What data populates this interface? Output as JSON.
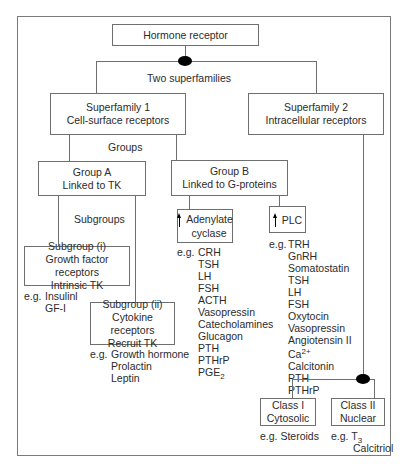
{
  "root": {
    "label": "Hormone receptor"
  },
  "split_label": "Two superfamilies",
  "superfamilies": [
    {
      "line1": "Superfamily 1",
      "line2": "Cell-surface receptors"
    },
    {
      "line1": "Superfamily 2",
      "line2": "Intracellular receptors"
    }
  ],
  "groups_label": "Groups",
  "groups": [
    {
      "line1": "Group A",
      "line2": "Linked to TK"
    },
    {
      "line1": "Group B",
      "line2": "Linked to G-proteins"
    }
  ],
  "subgroups_label": "Subgroups",
  "subgroups": [
    {
      "line1": "Subgroup (i)",
      "line2": "Growth factor receptors",
      "line3": "Intrinsic TK",
      "eg_prefix": "e.g.",
      "examples": [
        "Insulinl",
        "GF-I"
      ]
    },
    {
      "line1": "Subgroup (ii)",
      "line2": "Cytokine receptors",
      "line3": "Recruit TK",
      "eg_prefix": "e.g.",
      "examples": [
        "Growth hormone",
        "Prolactin",
        "Leptin"
      ]
    }
  ],
  "effectors": [
    {
      "label_line1": "Adenylate",
      "label_line2": "cyclase",
      "arrow": "up-arrow",
      "eg_prefix": "e.g.",
      "examples": [
        "CRH",
        "TSH",
        "LH",
        "FSH",
        "ACTH",
        "Vasopressin",
        "Catecholamines",
        "Glucagon",
        "PTH",
        "PTHrP"
      ],
      "last_example_base": "PGE",
      "last_example_sub": "2"
    },
    {
      "label_line1": "PLC",
      "arrow": "up-arrow",
      "eg_prefix": "e.g.",
      "examples_a": [
        "TRH",
        "GnRH",
        "Somatostatin",
        "TSH",
        "LH",
        "FSH",
        "Oxytocin",
        "Vasopressin",
        "Angiotensin II"
      ],
      "ca_base": "Ca",
      "ca_sup": "2+",
      "examples_b": [
        "Calcitonin",
        "PTH",
        "PTHrP"
      ]
    }
  ],
  "classes": [
    {
      "line1": "Class I",
      "line2": "Cytosolic",
      "eg_prefix": "e.g.",
      "examples": [
        "Steroids"
      ]
    },
    {
      "line1": "Class II",
      "line2": "Nuclear",
      "eg_prefix": "e.g.",
      "t3_base": "T",
      "t3_sub": "3",
      "examples": [
        "Calcitriol"
      ]
    }
  ]
}
